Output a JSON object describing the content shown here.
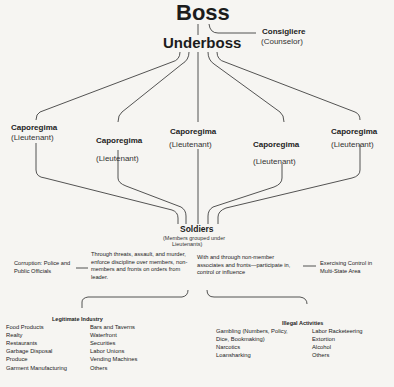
{
  "top": {
    "boss": "Boss",
    "underboss": "Underboss",
    "consigliere": {
      "title": "Consigliere",
      "subtitle": "(Counselor)"
    }
  },
  "caporegimes": [
    {
      "title": "Caporegima",
      "subtitle": "(Lieutenant)"
    },
    {
      "title": "Caporegima",
      "subtitle": "(Lieutenant)"
    },
    {
      "title": "Caporegima",
      "subtitle": "(Lieutenant)"
    },
    {
      "title": "Caporegima",
      "subtitle": "(Lieutenant)"
    },
    {
      "title": "Caporegima",
      "subtitle": "(Lieutenant)"
    }
  ],
  "soldiers": {
    "title": "Soldiers",
    "subtitle_line1": "(Members grouped under",
    "subtitle_line2": "Lieutenants)"
  },
  "middle": {
    "corruption": "Corruption: Police and Public Officials",
    "discipline": "Through threats, assault, and murder, enforce discipline over members, non-members and fronts on orders from leader.",
    "influence": "With and through non-member associates and fronts—participate in, control or influence",
    "control": "Exercising Control in Multi-State Area"
  },
  "legitimate": {
    "header": "Legitimate Industry",
    "col1": [
      "Food Products",
      "Realty",
      "Restaurants",
      "Garbage Disposal",
      "Produce",
      "Garment Manufacturing"
    ],
    "col2": [
      "Bars and Taverns",
      "Waterfront",
      "Securities",
      "Labor Unions",
      "Vending Machines",
      "Others"
    ]
  },
  "illegal": {
    "header": "Illegal Activities",
    "col1": [
      "Gambling (Numbers, Policy,",
      "Dice, Bookmaking)",
      "Narcotics",
      "Loansharking"
    ],
    "col2": [
      "Labor Racketeering",
      "Extortion",
      "Alcohol",
      "Others"
    ]
  }
}
